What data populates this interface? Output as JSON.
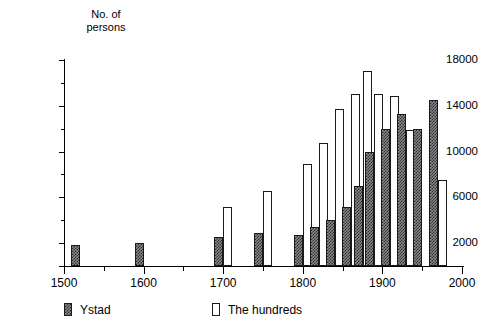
{
  "chart_data": {
    "type": "bar",
    "title": "",
    "ylabel": "No. of\npersons",
    "xlabel": "",
    "xlim": [
      1500,
      2000
    ],
    "ylim": [
      0,
      18000
    ],
    "grid": false,
    "legend_position": "bottom-left",
    "y_ticks_major": [
      0,
      2000,
      6000,
      10000,
      14000,
      18000
    ],
    "y_tick_labels": [
      "",
      "2000",
      "6000",
      "10000",
      "14000",
      "18000"
    ],
    "y_ticks_minor": [
      4000,
      8000,
      12000,
      16000
    ],
    "x_ticks_major": [
      1500,
      1600,
      1700,
      1800,
      1900,
      2000
    ],
    "x_tick_labels": [
      "1500",
      "1600",
      "1700",
      "1800",
      "1900",
      "2000"
    ],
    "x_ticks_minor": [
      1550,
      1650,
      1750,
      1850,
      1950
    ],
    "x": [
      1520,
      1600,
      1700,
      1750,
      1800,
      1820,
      1840,
      1860,
      1875,
      1890,
      1910,
      1930,
      1950,
      1970
    ],
    "series": [
      {
        "name": "Ystad",
        "color": "#2b2b2b",
        "fill": "hatched",
        "values": [
          1800,
          2050,
          2500,
          2850,
          2750,
          3400,
          4000,
          5200,
          7000,
          10000,
          11950,
          13250,
          12000,
          14500
        ]
      },
      {
        "name": "The hundreds",
        "color": "#ffffff",
        "fill": "open",
        "values": [
          null,
          null,
          5200,
          6550,
          8900,
          10750,
          13750,
          15000,
          17000,
          15000,
          14850,
          11900,
          null,
          7500
        ]
      }
    ]
  },
  "legend": {
    "items": [
      {
        "label": "Ystad",
        "swatch": "hatched-dark-square"
      },
      {
        "label": "The hundreds",
        "swatch": "open-white-square"
      }
    ]
  }
}
